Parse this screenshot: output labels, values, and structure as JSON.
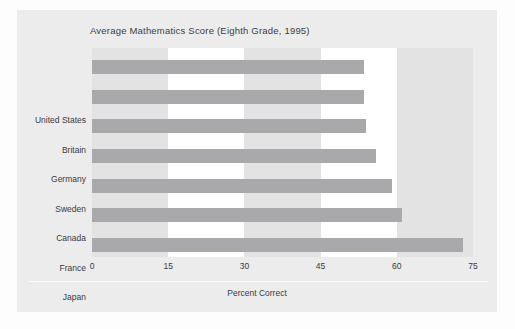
{
  "chart_data": {
    "type": "bar",
    "orientation": "horizontal",
    "title": "Average Mathematics Score (Eighth Grade, 1995)",
    "xlabel": "Percent Correct",
    "ylabel": "",
    "categories": [
      "United States",
      "Britain",
      "Germany",
      "Sweden",
      "Canada",
      "France",
      "Japan"
    ],
    "values": [
      53.5,
      53.5,
      54,
      56,
      59,
      61,
      73
    ],
    "series": [
      {
        "name": "Percent Correct",
        "values": [
          53.5,
          53.5,
          54,
          56,
          59,
          61,
          73
        ]
      }
    ],
    "xlim": [
      0,
      75
    ],
    "xticks": [
      0,
      15,
      30,
      45,
      60,
      75
    ],
    "xtick_labels": [
      "0",
      "15",
      "30",
      "45",
      "60",
      "75"
    ],
    "grid": false,
    "legend": false,
    "bands": "alternating vertical gray/white between tick intervals",
    "bar_color": "#a9a9ab",
    "band_color": "#e3e3e4",
    "plot_background": "#ffffff",
    "figure_background": "#ececed"
  },
  "colors": {
    "figure_panel": "#ececed",
    "plot_bg": "#ffffff",
    "band": "#e3e3e4",
    "bar": "#a9a9ab",
    "text": "#3b3b3d",
    "rule": "#fbfbfb"
  }
}
